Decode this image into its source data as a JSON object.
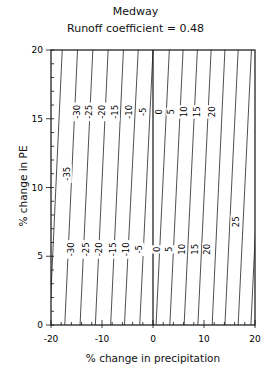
{
  "chart_data": {
    "type": "contour",
    "title": "Medway",
    "subtitle": "Runoff coefficient = 0.48",
    "xlabel": "% change in precipitation",
    "ylabel": "% change in PE",
    "xlim": [
      -20,
      20
    ],
    "ylim": [
      0,
      20
    ],
    "xticks": [
      "-20",
      "-10",
      "0",
      "10",
      "20"
    ],
    "yticks": [
      "0",
      "5",
      "10",
      "15",
      "20"
    ],
    "grid": false,
    "reference_line": {
      "x": 0
    },
    "contour_levels": [
      -35,
      -30,
      -25,
      -20,
      -15,
      -10,
      -5,
      0,
      5,
      10,
      15,
      20,
      25,
      30,
      35
    ],
    "contour_labels": [
      {
        "level": "-35",
        "x": -16.9,
        "y": 11.0
      },
      {
        "level": "-30",
        "x": -15.0,
        "y": 15.5
      },
      {
        "level": "-25",
        "x": -12.6,
        "y": 15.5
      },
      {
        "level": "-20",
        "x": -10.0,
        "y": 15.5
      },
      {
        "level": "-15",
        "x": -7.5,
        "y": 15.5
      },
      {
        "level": "-10",
        "x": -4.8,
        "y": 15.5
      },
      {
        "level": "-5",
        "x": -2.0,
        "y": 15.5
      },
      {
        "level": "0",
        "x": 1.2,
        "y": 15.5
      },
      {
        "level": "5",
        "x": 3.6,
        "y": 15.5
      },
      {
        "level": "10",
        "x": 6.1,
        "y": 15.5
      },
      {
        "level": "15",
        "x": 8.6,
        "y": 15.5
      },
      {
        "level": "20",
        "x": 11.5,
        "y": 15.5
      },
      {
        "level": "-30",
        "x": -16.0,
        "y": 5.5
      },
      {
        "level": "-25",
        "x": -13.2,
        "y": 5.5
      },
      {
        "level": "-20",
        "x": -10.6,
        "y": 5.5
      },
      {
        "level": "-15",
        "x": -7.9,
        "y": 5.5
      },
      {
        "level": "-10",
        "x": -5.3,
        "y": 5.5
      },
      {
        "level": "-5",
        "x": -2.7,
        "y": 5.5
      },
      {
        "level": "0",
        "x": 0.8,
        "y": 5.5
      },
      {
        "level": "5",
        "x": 3.2,
        "y": 5.5
      },
      {
        "level": "10",
        "x": 5.7,
        "y": 5.5
      },
      {
        "level": "15",
        "x": 8.2,
        "y": 5.5
      },
      {
        "level": "20",
        "x": 10.6,
        "y": 5.5
      },
      {
        "level": "25",
        "x": 16.2,
        "y": 7.5
      }
    ],
    "contour_lines_x_at_y0": [
      -23.3,
      -20.3,
      -17.3,
      -14.3,
      -11.3,
      -8.3,
      -5.6,
      -2.6,
      0.6,
      3.3,
      6.1,
      8.8,
      11.6,
      14.1,
      16.7,
      19.2
    ],
    "contour_lines_x_at_y20": [
      -20.7,
      -17.8,
      -14.8,
      -11.8,
      -8.8,
      -5.8,
      -2.9,
      0.0,
      3.2,
      5.9,
      8.7,
      11.4,
      14.1,
      16.7,
      19.3,
      21.8
    ]
  }
}
